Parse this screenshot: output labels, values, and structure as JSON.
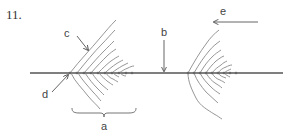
{
  "question": {
    "number": "11."
  },
  "labels": {
    "a": "a",
    "b": "b",
    "c": "c",
    "d": "d",
    "e": "e"
  },
  "colors": {
    "line": "#555555",
    "wave": "#8a8a8a",
    "text": "#444444"
  }
}
